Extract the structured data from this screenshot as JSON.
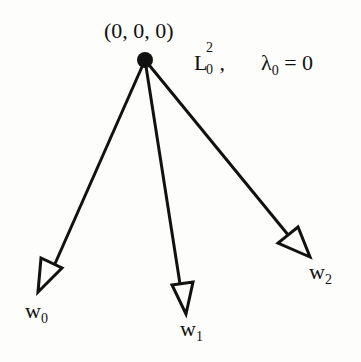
{
  "root": {
    "label": "(0, 0, 0)",
    "x": 145,
    "y": 60
  },
  "space_label": {
    "base": "L",
    "sup": "2",
    "sub": "0",
    "sep": ","
  },
  "eigen_label": {
    "symbol": "λ",
    "sub": "0",
    "rest": " = 0"
  },
  "arrows": [
    {
      "name": "w",
      "sub": "0",
      "tip_x": 38,
      "tip_y": 292
    },
    {
      "name": "w",
      "sub": "1",
      "tip_x": 186,
      "tip_y": 314
    },
    {
      "name": "w",
      "sub": "2",
      "tip_x": 310,
      "tip_y": 257
    }
  ],
  "colors": {
    "ink": "#111111",
    "background": "#fdfdfb"
  }
}
